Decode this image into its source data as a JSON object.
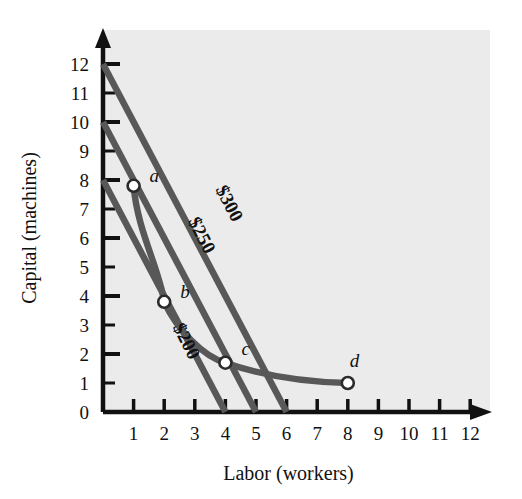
{
  "figure": {
    "background_color": "#ffffff",
    "plot_background_color": "#ebebeb",
    "line_color": "#585858",
    "axis_color": "#111111",
    "marker_fill": "#ffffff"
  },
  "chart_data": {
    "type": "line",
    "title": "",
    "xlabel": "Labor (workers)",
    "ylabel": "Capital (machines)",
    "xlim": [
      0,
      12.6
    ],
    "ylim": [
      0,
      12.8
    ],
    "xticks": [
      1,
      2,
      3,
      4,
      5,
      6,
      7,
      8,
      9,
      10,
      11,
      12
    ],
    "yticks": [
      1,
      2,
      3,
      4,
      5,
      6,
      7,
      8,
      9,
      10,
      11,
      12
    ],
    "xtick_labels": [
      "1",
      "2",
      "3",
      "4",
      "5",
      "6",
      "7",
      "8",
      "9",
      "10",
      "11",
      "12"
    ],
    "ytick_labels": [
      "1",
      "2",
      "3",
      "4",
      "5",
      "6",
      "7",
      "8",
      "9",
      "10",
      "11",
      "12"
    ],
    "y_origin_label": "0",
    "grid": false,
    "legend": "none",
    "series": [
      {
        "name": "$200",
        "kind": "isocost",
        "label": "$200",
        "label_rotation_deg": 63,
        "label_x": 2.55,
        "label_y": 2.35,
        "points": [
          [
            0,
            8
          ],
          [
            4,
            0
          ]
        ]
      },
      {
        "name": "$250",
        "kind": "isocost",
        "label": "$250",
        "label_rotation_deg": 63,
        "label_x": 3.05,
        "label_y": 6.0,
        "points": [
          [
            0,
            10
          ],
          [
            5,
            0
          ]
        ]
      },
      {
        "name": "$300",
        "kind": "isocost",
        "label": "$300",
        "label_rotation_deg": 63,
        "label_x": 3.95,
        "label_y": 7.1,
        "points": [
          [
            0,
            12
          ],
          [
            6,
            0
          ]
        ]
      },
      {
        "name": "isoquant",
        "kind": "isoquant",
        "label": "",
        "points": [
          [
            1,
            7.8
          ],
          [
            2,
            3.8
          ],
          [
            4,
            1.7
          ],
          [
            8,
            1.0
          ]
        ]
      }
    ],
    "markers": [
      {
        "label": "a",
        "x": 1,
        "y": 7.8,
        "label_dx": 16,
        "label_dy": -4
      },
      {
        "label": "b",
        "x": 2,
        "y": 3.8,
        "label_dx": 16,
        "label_dy": -4
      },
      {
        "label": "c",
        "x": 4,
        "y": 1.7,
        "label_dx": 16,
        "label_dy": -8
      },
      {
        "label": "d",
        "x": 8,
        "y": 1.0,
        "label_dx": 2,
        "label_dy": -16
      }
    ]
  }
}
